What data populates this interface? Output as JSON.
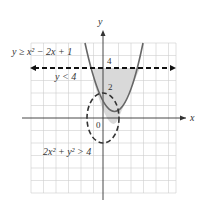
{
  "labels": {
    "y_axis": "y",
    "x_axis": "x",
    "origin": "0",
    "tick_4": "4",
    "tick_2": "2",
    "ineq1": "y ≥ x² − 2x + 1",
    "ineq2": "y < 4",
    "ineq3": "2x² + y² > 4"
  },
  "colors": {
    "grid": "#c8c8c8",
    "curve": "#666666",
    "shade": "#d9d9d9",
    "axis": "#333333"
  }
}
